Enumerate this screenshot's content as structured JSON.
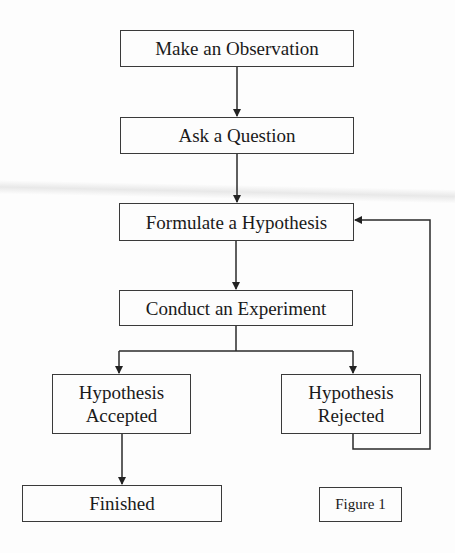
{
  "diagram": {
    "type": "flowchart",
    "nodes": [
      {
        "id": "observation",
        "label": "Make an Observation"
      },
      {
        "id": "question",
        "label": "Ask a Question"
      },
      {
        "id": "hypothesis",
        "label": "Formulate a Hypothesis"
      },
      {
        "id": "experiment",
        "label": "Conduct an Experiment"
      },
      {
        "id": "accepted",
        "label_line1": "Hypothesis",
        "label_line2": "Accepted"
      },
      {
        "id": "rejected",
        "label_line1": "Hypothesis",
        "label_line2": "Rejected"
      },
      {
        "id": "finished",
        "label": "Finished"
      }
    ],
    "edges": [
      {
        "from": "observation",
        "to": "question"
      },
      {
        "from": "question",
        "to": "hypothesis"
      },
      {
        "from": "hypothesis",
        "to": "experiment"
      },
      {
        "from": "experiment",
        "to": "accepted"
      },
      {
        "from": "experiment",
        "to": "rejected"
      },
      {
        "from": "accepted",
        "to": "finished"
      },
      {
        "from": "rejected",
        "to": "hypothesis"
      }
    ],
    "caption": "Figure 1",
    "colors": {
      "line": "#2a2a2a",
      "background": "#fdfdfd"
    }
  }
}
